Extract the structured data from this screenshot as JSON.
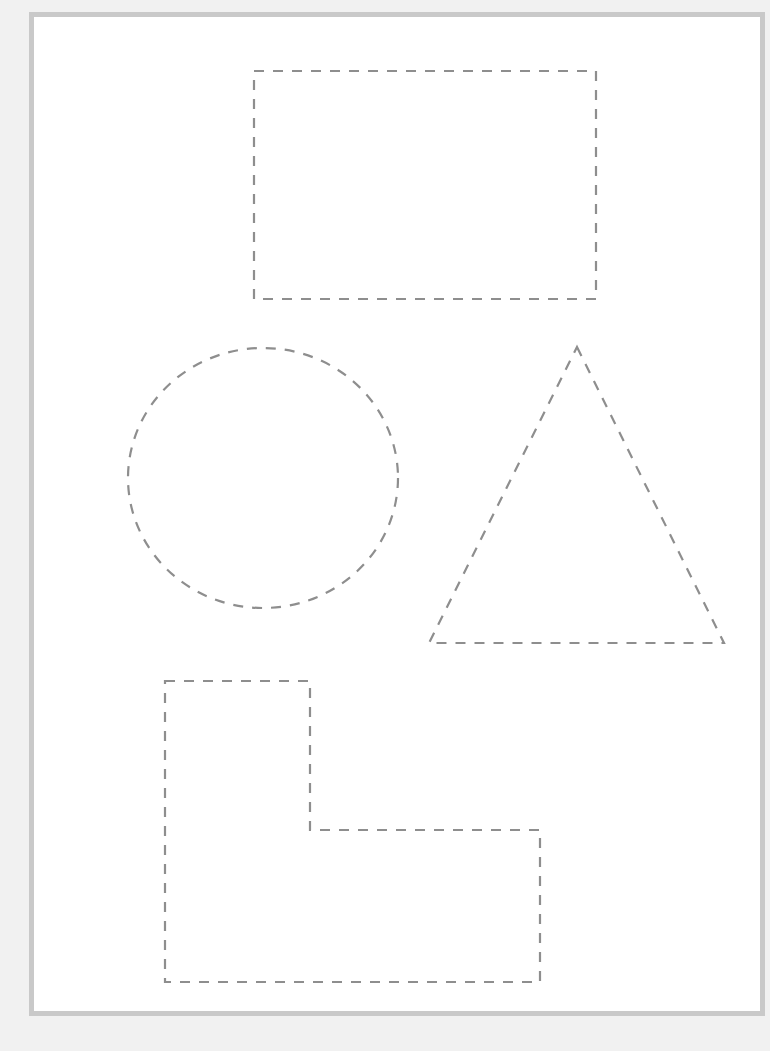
{
  "worksheet": {
    "frame": {
      "border_color": "#c9c9c9",
      "background": "#ffffff",
      "outer_background": "#f1f1f1"
    },
    "stroke": {
      "color": "#8e8e8e",
      "width": 2.2,
      "dash": "10 9"
    },
    "shapes": [
      {
        "id": "rectangle",
        "type": "rect",
        "x": 254,
        "y": 71,
        "width": 342,
        "height": 228
      },
      {
        "id": "circle",
        "type": "ellipse",
        "cx": 263,
        "cy": 478,
        "rx": 135,
        "ry": 130
      },
      {
        "id": "triangle",
        "type": "polygon",
        "points": "577,347 724,643 429,643"
      },
      {
        "id": "l-shape",
        "type": "polygon",
        "points": "165,681 310,681 310,830 540,830 540,982 165,982"
      }
    ]
  }
}
